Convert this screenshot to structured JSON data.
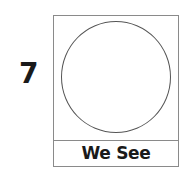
{
  "item": {
    "number": "7",
    "shape": "circle",
    "caption": "We See"
  }
}
